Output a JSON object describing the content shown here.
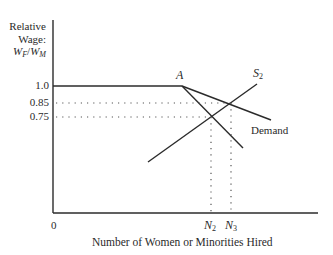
{
  "diagram": {
    "y_axis_label": {
      "line1": "Relative",
      "line2": "Wage:",
      "line3_num": "W",
      "line3_num_sub": "F",
      "line3_sep": "/",
      "line3_den": "W",
      "line3_den_sub": "M"
    },
    "y_ticks": [
      {
        "label": "1.0",
        "value": 1.0
      },
      {
        "label": "0.85",
        "value": 0.85
      },
      {
        "label": "0.75",
        "value": 0.75
      }
    ],
    "origin_label": "0",
    "x_axis_label": "Number of Women or Minorities Hired",
    "x_ticks": [
      {
        "label": "N",
        "sub": "2"
      },
      {
        "label": "N",
        "sub": "3"
      }
    ],
    "point_label": "A",
    "supply_label": "S",
    "supply_sub": "2",
    "demand_label": "Demand",
    "line_color": "#2b2b2b",
    "dot_color": "#555555"
  }
}
